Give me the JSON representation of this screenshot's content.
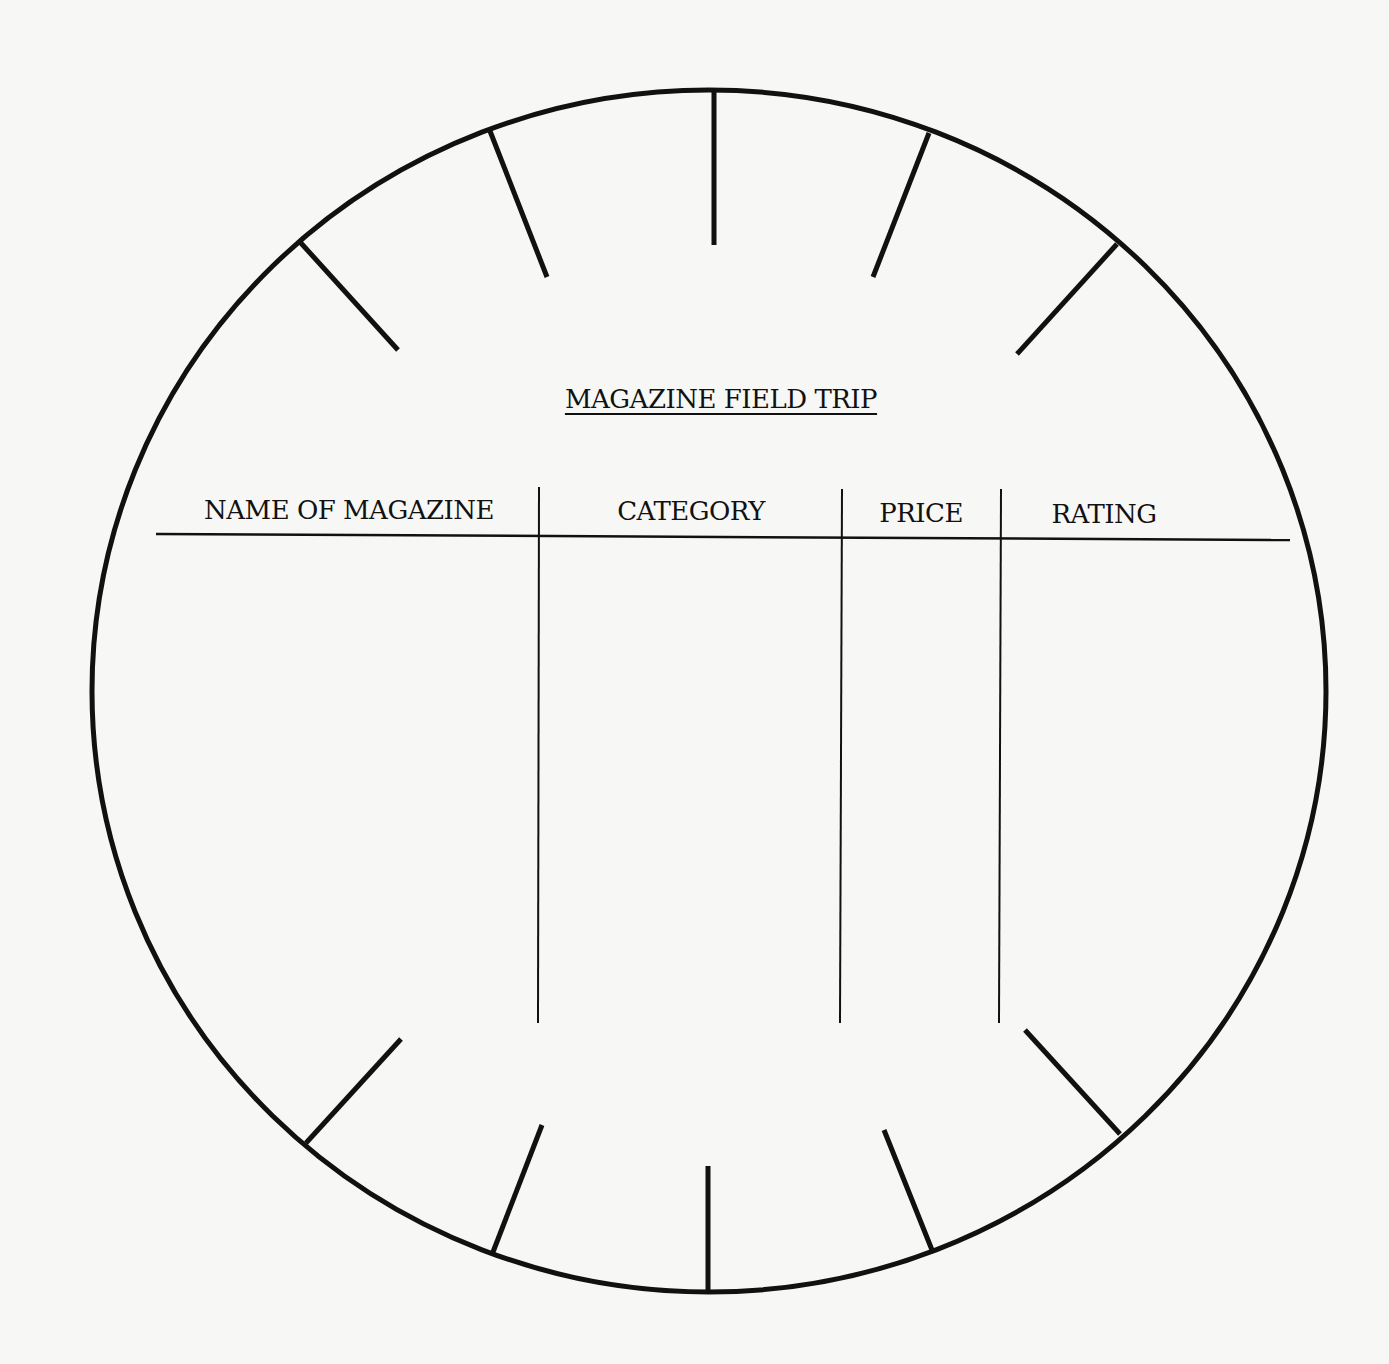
{
  "worksheet": {
    "title": "MAGAZINE FIELD TRIP",
    "columns": [
      {
        "label": "NAME OF MAGAZINE"
      },
      {
        "label": "CATEGORY"
      },
      {
        "label": "PRICE"
      },
      {
        "label": "RATING"
      }
    ],
    "rows": [],
    "ink_color": "#111111",
    "paper_color": "#f7f7f6"
  }
}
